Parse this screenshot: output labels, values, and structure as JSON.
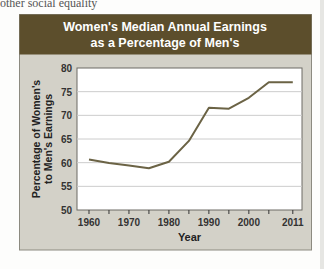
{
  "page": {
    "top_text": "other social equality"
  },
  "chart_data": {
    "type": "line",
    "title": "Women's Median Annual Earnings as a Percentage of Men's",
    "title_lines": [
      "Women's Median Annual Earnings",
      "as a Percentage of Men's"
    ],
    "xlabel": "Year",
    "ylabel": "Percentage of Women's to Men's Earnings",
    "ylabel_lines": [
      "Percentage of Women's",
      "to Men's Earnings"
    ],
    "x": [
      1960,
      1965,
      1970,
      1975,
      1980,
      1985,
      1990,
      1995,
      2000,
      2005,
      2011
    ],
    "series": [
      {
        "name": "Women's earnings as % of men's",
        "values": [
          60.7,
          59.9,
          59.4,
          58.8,
          60.2,
          64.6,
          71.6,
          71.4,
          73.7,
          77.0,
          77.0
        ]
      }
    ],
    "xtick_labels": [
      "1960",
      "1970",
      "1980",
      "1990",
      "2000",
      "2011"
    ],
    "ytick_labels": [
      "50",
      "55",
      "60",
      "65",
      "70",
      "75",
      "80"
    ],
    "ylim": [
      50,
      80
    ],
    "grid": true,
    "legend": "none",
    "colors": {
      "header_bg": "#5c4e2c",
      "panel_bg": "#d3d1c8",
      "line": "#6b6345",
      "grid": "#cccccc"
    }
  }
}
